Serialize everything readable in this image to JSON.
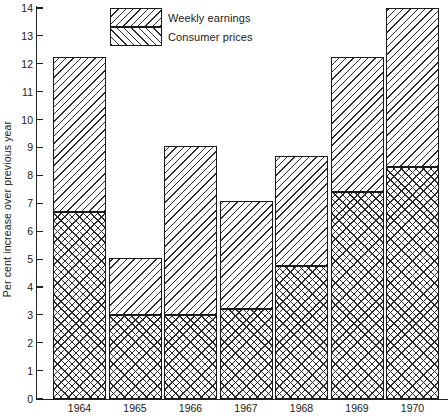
{
  "chart_data": {
    "type": "bar",
    "stacked": true,
    "title": "",
    "subtitle": "",
    "xlabel": "",
    "ylabel": "Per cent increase over previous year",
    "categories": [
      "1964",
      "1965",
      "1966",
      "1967",
      "1968",
      "1969",
      "1970"
    ],
    "series": [
      {
        "name": "Consumer prices",
        "values": [
          6.7,
          3.0,
          3.0,
          3.2,
          4.75,
          7.4,
          8.3
        ]
      },
      {
        "name": "Weekly earnings",
        "values": [
          12.25,
          5.05,
          9.05,
          7.1,
          8.7,
          12.25,
          14.0
        ],
        "note": "total bar height (weekly earnings); consumer-price portion is drawn inside it"
      }
    ],
    "ylim": [
      0,
      14
    ],
    "ytick_labels": [
      "0",
      "1",
      "2",
      "3",
      "4",
      "5",
      "6",
      "7",
      "8",
      "9",
      "10",
      "11",
      "12",
      "13",
      "14"
    ],
    "ytick_values": [
      0,
      1,
      2,
      3,
      4,
      5,
      6,
      7,
      8,
      9,
      10,
      11,
      12,
      13,
      14
    ],
    "grid": false,
    "legend_position": "top-center",
    "legend": [
      {
        "label": "Weekly earnings",
        "pattern": "diagonal-hatch"
      },
      {
        "label": "Consumer prices",
        "pattern": "diagonal-hatch-reverse"
      }
    ],
    "colors": {
      "ink": "#1a1a1a",
      "hatch": "#2b2b2b",
      "background": "#ffffff"
    }
  }
}
